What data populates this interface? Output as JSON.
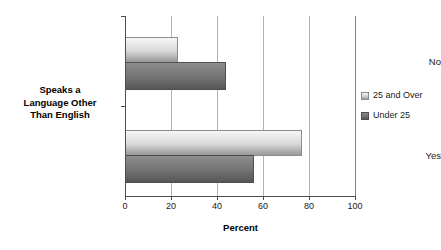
{
  "chart_data": {
    "type": "bar",
    "orientation": "horizontal",
    "title": "",
    "xlabel": "Percent",
    "ylabel": "Speaks a Language Other Than English",
    "ylabel_lines": [
      "Speaks a",
      "Language Other",
      "Than English"
    ],
    "categories": [
      "No",
      "Yes"
    ],
    "series": [
      {
        "name": "25 and Over",
        "values": [
          23,
          77
        ],
        "color": "#d8d8d8"
      },
      {
        "name": "Under 25",
        "values": [
          44,
          56
        ],
        "color": "#757575"
      }
    ],
    "xlim": [
      0,
      100
    ],
    "xticks": [
      0,
      20,
      40,
      60,
      80,
      100
    ],
    "xtick_labels": [
      "0",
      "20",
      "40",
      "60",
      "80",
      "100"
    ],
    "grid": "vertical",
    "legend_position": "right",
    "legend_entries": [
      "25 and Over",
      "Under 25"
    ]
  }
}
